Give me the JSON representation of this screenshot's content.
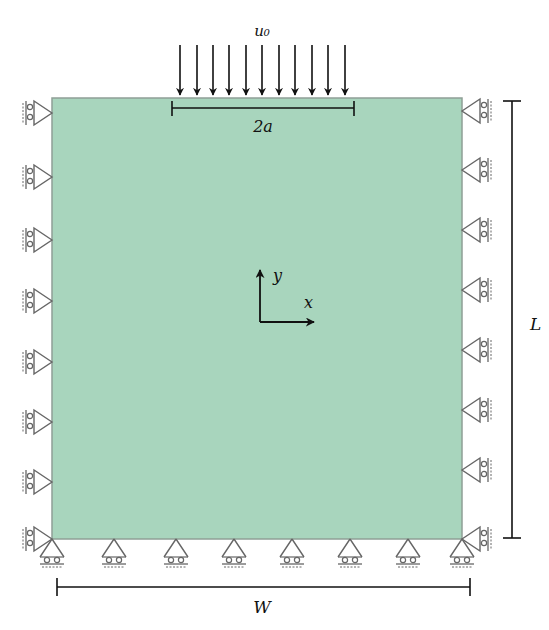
{
  "diagram": {
    "type": "boundary-value-problem-schematic",
    "domain_color": "#a8d5bd",
    "domain_edge_color": "#8a9a90",
    "support_color": "#555555",
    "arrow_color": "#111111",
    "labels": {
      "load": "u₀",
      "load_width": "2a",
      "height": "L",
      "width": "W",
      "axis_x": "x",
      "axis_y": "y"
    },
    "load_arrow_count": 11,
    "left_roller_supports": 8,
    "right_roller_supports": 8,
    "bottom_roller_supports": 8
  }
}
